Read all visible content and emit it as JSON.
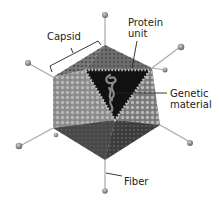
{
  "diagram": {
    "labels": {
      "capsid": "Capsid",
      "protein_unit_line1": "Protein",
      "protein_unit_line2": "unit",
      "genetic_material_line1": "Genetic",
      "genetic_material_line2": "material",
      "fiber": "Fiber"
    },
    "colors": {
      "face_light": "#8a8a8a",
      "face_mid": "#6b6b6b",
      "face_dark": "#3c3c3c",
      "bead": "#c8c8c8",
      "core": "#111111",
      "dna": "#7a7a7a",
      "fiber_line": "#a8a8a8",
      "fiber_ball": "#8c8c8c",
      "leader_line": "#222222"
    }
  }
}
